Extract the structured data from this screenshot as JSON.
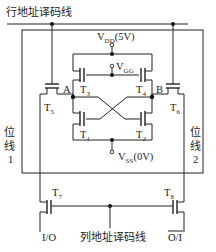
{
  "diagram": {
    "row_line_label": "行地址译码线",
    "column_line_label": "列地址译码线",
    "vdd": {
      "name": "V",
      "sub": "DD",
      "value": "(5V)"
    },
    "vgg": {
      "name": "V",
      "sub": "GG"
    },
    "vss": {
      "name": "V",
      "sub": "SS",
      "value": "(0V)"
    },
    "nodes": {
      "a": "A",
      "b": "B"
    },
    "transistors": {
      "t1": {
        "name": "T",
        "sub": "1"
      },
      "t2": {
        "name": "T",
        "sub": "2"
      },
      "t3": {
        "name": "T",
        "sub": "3"
      },
      "t4": {
        "name": "T",
        "sub": "4"
      },
      "t5": {
        "name": "T",
        "sub": "5"
      },
      "t6": {
        "name": "T",
        "sub": "6"
      },
      "t7": {
        "name": "T",
        "sub": "7"
      },
      "t8": {
        "name": "T",
        "sub": "8"
      }
    },
    "bit_line_1": {
      "line1": "位",
      "line2": "线",
      "line3": "1"
    },
    "bit_line_2": {
      "line1": "位",
      "line2": "线",
      "line3": "2"
    },
    "io": "I/O",
    "io_bar": "O/I"
  }
}
